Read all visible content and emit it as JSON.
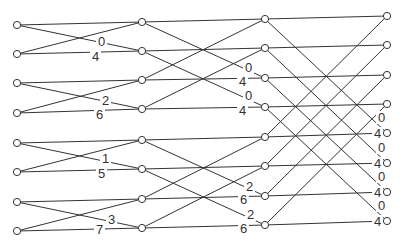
{
  "diagram": {
    "title": "",
    "type": "fft-butterfly",
    "colors": {
      "line": "#333333",
      "background": "#ffffff"
    },
    "columns": [
      {
        "x": 17,
        "y": [
          25,
          54,
          83,
          113,
          143,
          172,
          202,
          231
        ]
      },
      {
        "x": 142,
        "y": [
          22,
          51,
          80,
          109,
          140,
          169,
          199,
          228
        ]
      },
      {
        "x": 265,
        "y": [
          19,
          48,
          78,
          107,
          137,
          166,
          196,
          225
        ]
      },
      {
        "x": 387,
        "y": [
          16,
          45,
          75,
          104,
          133,
          163,
          192,
          221
        ]
      }
    ],
    "stages": [
      {
        "span": 1,
        "groups": [
          [
            0,
            1
          ],
          [
            2,
            3
          ],
          [
            4,
            5
          ],
          [
            6,
            7
          ]
        ]
      },
      {
        "span": 2,
        "groups": [
          [
            0,
            2
          ],
          [
            1,
            3
          ],
          [
            4,
            6
          ],
          [
            5,
            7
          ]
        ]
      },
      {
        "span": 4,
        "groups": [
          [
            0,
            4
          ],
          [
            1,
            5
          ],
          [
            2,
            6
          ],
          [
            3,
            7
          ]
        ]
      }
    ],
    "labels": [
      {
        "text": "0",
        "x": 98,
        "y": 46
      },
      {
        "text": "4",
        "x": 92,
        "y": 61
      },
      {
        "text": "2",
        "x": 102,
        "y": 105
      },
      {
        "text": "6",
        "x": 96,
        "y": 119
      },
      {
        "text": "1",
        "x": 102,
        "y": 163
      },
      {
        "text": "5",
        "x": 98,
        "y": 178
      },
      {
        "text": "3",
        "x": 108,
        "y": 224
      },
      {
        "text": "7",
        "x": 96,
        "y": 234
      },
      {
        "text": "0",
        "x": 245,
        "y": 72
      },
      {
        "text": "4",
        "x": 239,
        "y": 86
      },
      {
        "text": "0",
        "x": 245,
        "y": 100
      },
      {
        "text": "4",
        "x": 239,
        "y": 115
      },
      {
        "text": "2",
        "x": 246,
        "y": 191
      },
      {
        "text": "6",
        "x": 240,
        "y": 204
      },
      {
        "text": "2",
        "x": 247,
        "y": 219
      },
      {
        "text": "6",
        "x": 240,
        "y": 233
      },
      {
        "text": "0",
        "x": 378,
        "y": 122
      },
      {
        "text": "4",
        "x": 374,
        "y": 138
      },
      {
        "text": "0",
        "x": 378,
        "y": 152
      },
      {
        "text": "4",
        "x": 374,
        "y": 168
      },
      {
        "text": "0",
        "x": 378,
        "y": 181
      },
      {
        "text": "4",
        "x": 374,
        "y": 197
      },
      {
        "text": "0",
        "x": 378,
        "y": 210
      },
      {
        "text": "4",
        "x": 374,
        "y": 226
      }
    ]
  }
}
